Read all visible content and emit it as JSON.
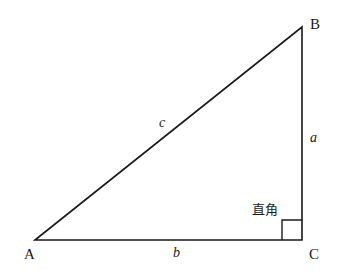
{
  "diagram": {
    "type": "right-triangle",
    "vertices": {
      "A": {
        "label": "A",
        "x": 35,
        "y": 240
      },
      "B": {
        "label": "B",
        "x": 302,
        "y": 27
      },
      "C": {
        "label": "C",
        "x": 302,
        "y": 240
      }
    },
    "sides": {
      "a": {
        "label": "a",
        "between": "B-C"
      },
      "b": {
        "label": "b",
        "between": "A-C"
      },
      "c": {
        "label": "c",
        "between": "A-B"
      }
    },
    "right_angle": {
      "label": "直角",
      "at": "C",
      "marker_size": 20
    },
    "colors": {
      "stroke": "#1a1a1a",
      "background": "#ffffff"
    }
  }
}
